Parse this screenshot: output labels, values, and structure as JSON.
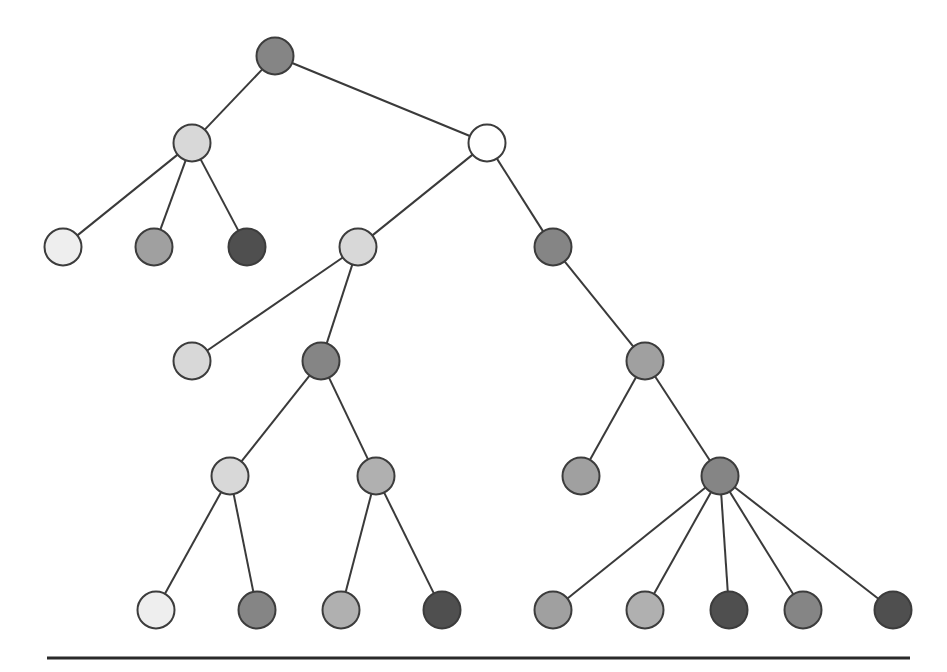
{
  "diagram": {
    "type": "tree",
    "shade_palette": {
      "white": "#ffffff",
      "very_light": "#eeeeee",
      "light": "#d8d8d8",
      "mid_light": "#b0b0b0",
      "mid": "#a0a0a0",
      "mid_dark": "#858585",
      "dark": "#4f4f4f"
    },
    "edge_color": "#3a3a3a",
    "node_stroke": "#3c3c3c",
    "baseline_color": "#2a2a2a",
    "nodes": [
      {
        "id": "n0",
        "parent": null,
        "shade": "mid_dark"
      },
      {
        "id": "n1",
        "parent": "n0",
        "shade": "light"
      },
      {
        "id": "n2",
        "parent": "n0",
        "shade": "white"
      },
      {
        "id": "n3",
        "parent": "n1",
        "shade": "very_light"
      },
      {
        "id": "n4",
        "parent": "n1",
        "shade": "mid"
      },
      {
        "id": "n5",
        "parent": "n1",
        "shade": "dark"
      },
      {
        "id": "n6",
        "parent": "n2",
        "shade": "light"
      },
      {
        "id": "n7",
        "parent": "n2",
        "shade": "mid_dark"
      },
      {
        "id": "n8",
        "parent": "n6",
        "shade": "light"
      },
      {
        "id": "n9",
        "parent": "n6",
        "shade": "mid_dark"
      },
      {
        "id": "n10",
        "parent": "n7",
        "shade": "mid"
      },
      {
        "id": "n11",
        "parent": "n9",
        "shade": "light"
      },
      {
        "id": "n12",
        "parent": "n9",
        "shade": "mid_light"
      },
      {
        "id": "n13",
        "parent": "n10",
        "shade": "mid"
      },
      {
        "id": "n14",
        "parent": "n10",
        "shade": "mid_dark"
      },
      {
        "id": "n15",
        "parent": "n11",
        "shade": "very_light"
      },
      {
        "id": "n16",
        "parent": "n11",
        "shade": "mid_dark"
      },
      {
        "id": "n17",
        "parent": "n12",
        "shade": "mid_light"
      },
      {
        "id": "n18",
        "parent": "n12",
        "shade": "dark"
      },
      {
        "id": "n19",
        "parent": "n14",
        "shade": "mid"
      },
      {
        "id": "n20",
        "parent": "n14",
        "shade": "mid_light"
      },
      {
        "id": "n21",
        "parent": "n14",
        "shade": "dark"
      },
      {
        "id": "n22",
        "parent": "n14",
        "shade": "mid_dark"
      },
      {
        "id": "n23",
        "parent": "n14",
        "shade": "dark"
      }
    ]
  }
}
